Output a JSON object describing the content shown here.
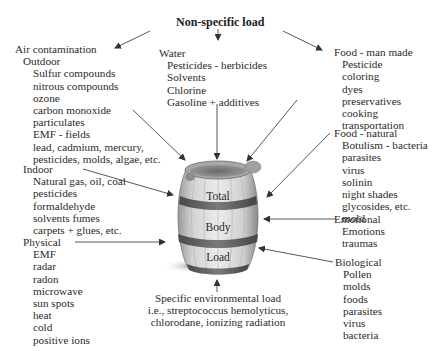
{
  "title": "Non-specific load",
  "barrel": {
    "labels": [
      "Total",
      "Body",
      "Load"
    ]
  },
  "air": {
    "heading": "Air contamination",
    "outdoor": {
      "heading": "Outdoor",
      "items": [
        "Sulfur compounds",
        "nitrous compounds",
        "ozone",
        "carbon monoxide",
        "particulates",
        "EMF - fields",
        "lead, cadmium, mercury,",
        "pesticides, molds, algae, etc."
      ]
    },
    "indoor": {
      "heading": "Indoor",
      "items": [
        "Natural gas, oil, coal",
        "pesticides",
        "formaldehyde",
        "solvents fumes",
        "carpets + glues, etc."
      ]
    }
  },
  "physical": {
    "heading": "Physical",
    "items": [
      "EMF",
      "radar",
      "radon",
      "microwave",
      "sun spots",
      "heat",
      "cold",
      "positive ions"
    ]
  },
  "water": {
    "heading": "Water",
    "items": [
      "Pesticides - herbicides",
      "Solvents",
      "Chlorine",
      "Gasoline + additives"
    ]
  },
  "food_man_made": {
    "heading": "Food - man made",
    "items": [
      "Pesticide",
      "coloring",
      "dyes",
      "preservatives",
      "cooking",
      "transportation"
    ]
  },
  "food_natural": {
    "heading": "Food - natural",
    "items": [
      "Botulism - bacteria",
      "parasites",
      "virus",
      "solinin",
      "night shades",
      "glycosides, etc.",
      "mold"
    ]
  },
  "emotional": {
    "heading": "Emotional",
    "items": [
      "Emotions",
      "traumas"
    ]
  },
  "biological": {
    "heading": "Biological",
    "items": [
      "Pollen",
      "molds",
      "foods",
      "parasites",
      "virus",
      "bacteria"
    ]
  },
  "specific": {
    "lines": [
      "Specific environmental load",
      "i.e., streptococcus hemolyticus,",
      "chlorodane, ionizing radiation"
    ]
  },
  "colors": {
    "arrow": "#444444",
    "barrel_wood": "#d6d6d6",
    "barrel_band": "#6e6e6e",
    "text": "#2a2a2a"
  }
}
